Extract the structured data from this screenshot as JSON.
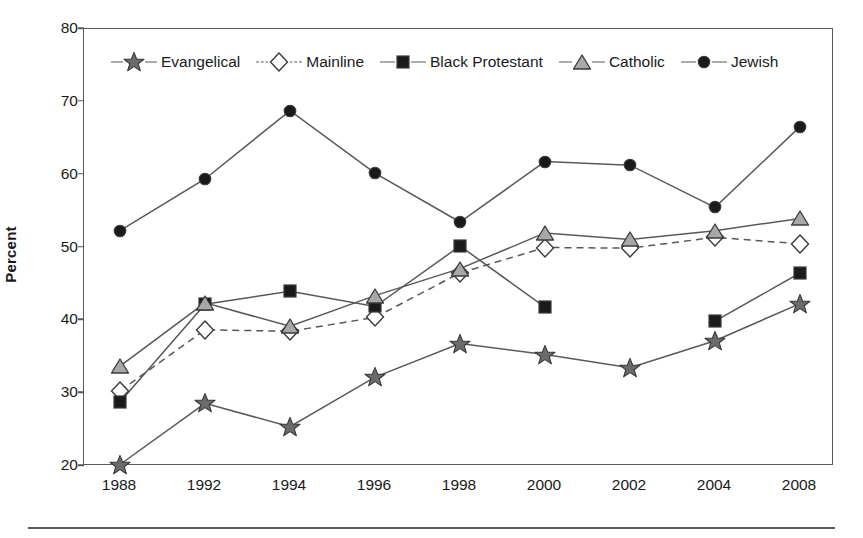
{
  "chart_data": {
    "type": "line",
    "title": "",
    "xlabel": "",
    "ylabel": "Percent",
    "ylim": [
      20,
      80
    ],
    "yticks": [
      20,
      30,
      40,
      50,
      60,
      70,
      80
    ],
    "grid": false,
    "legend_position": "top-inside",
    "categories": [
      "1988",
      "1992",
      "1994",
      "1996",
      "1998",
      "2000",
      "2002",
      "2004",
      "2008"
    ],
    "series": [
      {
        "name": "Evangelical",
        "marker": "star",
        "marker_color": "#6b6b6e",
        "line_style": "solid",
        "line_color": "#58585a",
        "values": [
          20.2,
          28.6,
          25.4,
          32.2,
          36.8,
          35.3,
          33.5,
          37.2,
          42.3
        ]
      },
      {
        "name": "Mainline",
        "marker": "diamond",
        "marker_color": "#ffffff",
        "line_style": "dashed",
        "line_color": "#58585a",
        "values": [
          30.3,
          38.7,
          38.5,
          40.4,
          46.5,
          50.0,
          49.9,
          51.4,
          50.5
        ]
      },
      {
        "name": "Black Protestant",
        "marker": "square",
        "marker_color": "#1a1a1a",
        "line_style": "solid",
        "line_color": "#58585a",
        "values": [
          28.8,
          42.2,
          44.0,
          41.9,
          50.2,
          41.8,
          null,
          39.9,
          46.5
        ]
      },
      {
        "name": "Catholic",
        "marker": "triangle",
        "marker_color": "#a8a8aa",
        "line_style": "solid",
        "line_color": "#58585a",
        "values": [
          33.7,
          42.4,
          39.2,
          43.4,
          47.1,
          52.0,
          51.1,
          52.3,
          54.0
        ]
      },
      {
        "name": "Jewish",
        "marker": "circle",
        "marker_color": "#1a1a1a",
        "line_style": "solid",
        "line_color": "#58585a",
        "values": [
          52.3,
          59.4,
          68.8,
          60.2,
          53.5,
          61.8,
          61.3,
          55.5,
          66.6
        ]
      }
    ]
  },
  "axis": {
    "y_title": "Percent",
    "y_tick_labels": [
      "20",
      "30",
      "40",
      "50",
      "60",
      "70",
      "80"
    ],
    "x_tick_labels": [
      "1988",
      "1992",
      "1994",
      "1996",
      "1998",
      "2000",
      "2002",
      "2004",
      "2008"
    ]
  },
  "legend": {
    "entries": [
      {
        "label": "Evangelical",
        "icon": "star-marker-icon",
        "line_style": "solid"
      },
      {
        "label": "Mainline",
        "icon": "diamond-marker-icon",
        "line_style": "dashed"
      },
      {
        "label": "Black Protestant",
        "icon": "square-marker-icon",
        "line_style": "solid"
      },
      {
        "label": "Catholic",
        "icon": "triangle-marker-icon",
        "line_style": "solid"
      },
      {
        "label": "Jewish",
        "icon": "circle-marker-icon",
        "line_style": "solid"
      }
    ]
  },
  "colors": {
    "frame": "#58585a",
    "text": "#1a1a1a",
    "background": "#ffffff"
  }
}
